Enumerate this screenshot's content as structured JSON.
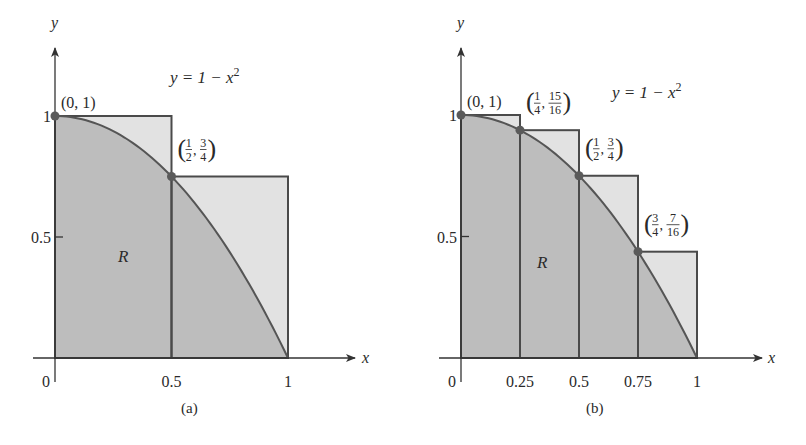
{
  "colors": {
    "under_curve": "#bdbdbd",
    "over_curve": "#e2e2e2",
    "stroke": "#4a4a4a",
    "curve": "#555555",
    "point": "#5a5a5a",
    "text": "#2a2a2a"
  },
  "chart_data": [
    {
      "type": "area",
      "panel": "a",
      "caption": "(a)",
      "title": "",
      "function": "y = 1 - x^2",
      "function_label": "y = 1 − x",
      "function_label_exp": "2",
      "region_label": "R",
      "xlabel": "x",
      "ylabel": "y",
      "xlim": [
        0,
        1
      ],
      "ylim": [
        0,
        1
      ],
      "x_ticks": [
        "0",
        "0.5",
        "1"
      ],
      "y_ticks": [
        "0.5",
        "1"
      ],
      "rectangles": [
        {
          "x0": 0,
          "x1": 0.5,
          "height": 1
        },
        {
          "x0": 0.5,
          "x1": 1,
          "height": 0.75
        }
      ],
      "points": [
        {
          "x": 0,
          "y": 1,
          "label": "(0, 1)"
        },
        {
          "x": 0.5,
          "y": 0.75,
          "label": "(1/2, 3/4)",
          "num1": "1",
          "den1": "2",
          "num2": "3",
          "den2": "4"
        }
      ],
      "grid": false
    },
    {
      "type": "area",
      "panel": "b",
      "caption": "(b)",
      "title": "",
      "function": "y = 1 - x^2",
      "function_label": "y = 1 − x",
      "function_label_exp": "2",
      "region_label": "R",
      "xlabel": "x",
      "ylabel": "y",
      "xlim": [
        0,
        1
      ],
      "ylim": [
        0,
        1
      ],
      "x_ticks": [
        "0",
        "0.25",
        "0.5",
        "0.75",
        "1"
      ],
      "y_ticks": [
        "0.5",
        "1"
      ],
      "rectangles": [
        {
          "x0": 0,
          "x1": 0.25,
          "height": 1
        },
        {
          "x0": 0.25,
          "x1": 0.5,
          "height": 0.9375
        },
        {
          "x0": 0.5,
          "x1": 0.75,
          "height": 0.75
        },
        {
          "x0": 0.75,
          "x1": 1,
          "height": 0.4375
        }
      ],
      "points": [
        {
          "x": 0,
          "y": 1,
          "label": "(0, 1)"
        },
        {
          "x": 0.25,
          "y": 0.9375,
          "label": "(1/4, 15/16)",
          "num1": "1",
          "den1": "4",
          "num2": "15",
          "den2": "16"
        },
        {
          "x": 0.5,
          "y": 0.75,
          "label": "(1/2, 3/4)",
          "num1": "1",
          "den1": "2",
          "num2": "3",
          "den2": "4"
        },
        {
          "x": 0.75,
          "y": 0.4375,
          "label": "(3/4, 7/16)",
          "num1": "3",
          "den1": "4",
          "num2": "7",
          "den2": "16"
        }
      ],
      "grid": false
    }
  ]
}
